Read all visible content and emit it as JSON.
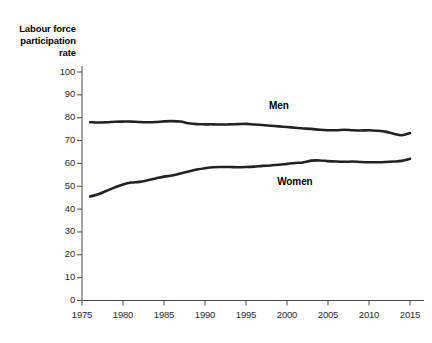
{
  "chart_data": {
    "type": "line",
    "title": "",
    "subtitle": "",
    "ylabel": "Labour force\nparticipation\nrate",
    "xlabel": "",
    "xlim": [
      1975,
      2015
    ],
    "ylim": [
      0,
      100
    ],
    "grid": false,
    "legend_position": "inline-annotation",
    "y_ticks": [
      0,
      10,
      20,
      30,
      40,
      50,
      60,
      70,
      80,
      90,
      100
    ],
    "y_tick_labels": [
      "0",
      "10",
      "20",
      "30",
      "40",
      "50",
      "60",
      "70",
      "80",
      "90",
      "100"
    ],
    "x_ticks": [
      1975,
      1980,
      1985,
      1990,
      1995,
      2000,
      2005,
      2010,
      2015
    ],
    "x_tick_labels": [
      "1975",
      "1980",
      "1985",
      "1990",
      "1995",
      "2000",
      "2005",
      "2010",
      "2015"
    ],
    "x": [
      1976,
      1977,
      1978,
      1979,
      1980,
      1981,
      1982,
      1983,
      1984,
      1985,
      1986,
      1987,
      1988,
      1989,
      1990,
      1991,
      1992,
      1993,
      1994,
      1995,
      1996,
      1997,
      1998,
      1999,
      2000,
      2001,
      2002,
      2003,
      2004,
      2005,
      2006,
      2007,
      2008,
      2009,
      2010,
      2011,
      2012,
      2013,
      2014,
      2015
    ],
    "series": [
      {
        "name": "Men",
        "color": "#222222",
        "label_x": 2000,
        "label_y": 85,
        "values": [
          78.0,
          77.9,
          78.0,
          78.2,
          78.3,
          78.3,
          78.1,
          78.0,
          78.1,
          78.4,
          78.5,
          78.3,
          77.6,
          77.2,
          77.1,
          77.1,
          77.0,
          77.1,
          77.2,
          77.3,
          77.0,
          76.8,
          76.5,
          76.2,
          75.9,
          75.6,
          75.3,
          75.1,
          74.7,
          74.5,
          74.5,
          74.7,
          74.5,
          74.4,
          74.5,
          74.3,
          73.9,
          73.0,
          72.3,
          73.3
        ],
        "ylim_note": "values read off y axis in percent"
      },
      {
        "name": "Women",
        "color": "#222222",
        "label_x": 2001,
        "label_y": 52,
        "values": [
          45.5,
          46.5,
          48.0,
          49.5,
          50.8,
          51.6,
          51.9,
          52.6,
          53.4,
          54.2,
          54.7,
          55.6,
          56.5,
          57.3,
          57.9,
          58.3,
          58.4,
          58.4,
          58.3,
          58.4,
          58.6,
          58.9,
          59.1,
          59.4,
          59.8,
          60.2,
          60.4,
          61.2,
          61.3,
          61.0,
          60.8,
          60.7,
          60.8,
          60.6,
          60.5,
          60.5,
          60.6,
          60.8,
          61.1,
          62.0
        ],
        "ylim_note": "values read off y axis in percent"
      }
    ]
  }
}
